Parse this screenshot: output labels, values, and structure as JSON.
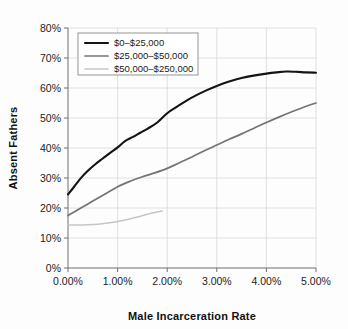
{
  "chart_data": {
    "type": "line",
    "title": "",
    "xlabel": "Male Incarceration Rate",
    "ylabel": "Absent Fathers",
    "xlim": [
      0,
      5
    ],
    "ylim": [
      0,
      80
    ],
    "grid": true,
    "legend_position": "top-left",
    "x_tick_labels": [
      "0.00%",
      "1.00%",
      "2.00%",
      "3.00%",
      "4.00%",
      "5.00%"
    ],
    "x_ticks": [
      0,
      1,
      2,
      3,
      4,
      5
    ],
    "y_tick_labels": [
      "0%",
      "10%",
      "20%",
      "30%",
      "40%",
      "50%",
      "60%",
      "70%",
      "80%"
    ],
    "y_ticks": [
      0,
      10,
      20,
      30,
      40,
      50,
      60,
      70,
      80
    ],
    "series": [
      {
        "name": "$0–$25,000",
        "color": "#141414",
        "width": 2.1,
        "x": [
          0.0,
          0.12,
          0.25,
          0.4,
          0.55,
          0.7,
          0.85,
          1.0,
          1.15,
          1.3,
          1.45,
          1.6,
          1.8,
          2.0,
          2.2,
          2.4,
          2.6,
          2.8,
          3.0,
          3.2,
          3.4,
          3.6,
          3.8,
          4.0,
          4.2,
          4.4,
          4.6,
          4.8,
          5.0
        ],
        "values": [
          24.5,
          27.0,
          29.8,
          32.4,
          34.6,
          36.5,
          38.4,
          40.2,
          42.3,
          43.6,
          45.0,
          46.4,
          48.5,
          51.6,
          53.8,
          55.9,
          57.7,
          59.3,
          60.7,
          61.9,
          62.9,
          63.7,
          64.3,
          64.8,
          65.2,
          65.5,
          65.4,
          65.2,
          65.1
        ]
      },
      {
        "name": "$25,000–$50,000",
        "color": "#747474",
        "width": 1.7,
        "x": [
          0.0,
          0.25,
          0.5,
          0.75,
          1.0,
          1.25,
          1.5,
          1.75,
          2.0,
          2.25,
          2.5,
          2.75,
          3.0,
          3.25,
          3.5,
          3.75,
          4.0,
          4.25,
          4.5,
          4.75,
          5.0
        ],
        "values": [
          17.5,
          19.9,
          22.3,
          24.7,
          27.1,
          28.9,
          30.4,
          31.7,
          33.2,
          35.1,
          37.0,
          39.1,
          41.0,
          42.9,
          44.7,
          46.6,
          48.5,
          50.3,
          52.0,
          53.6,
          55.0
        ]
      },
      {
        "name": "$50,000–$250,000",
        "color": "#c6c6c6",
        "width": 1.5,
        "x": [
          0.0,
          0.2,
          0.4,
          0.6,
          0.8,
          1.0,
          1.2,
          1.4,
          1.6,
          1.75,
          1.9
        ],
        "values": [
          14.3,
          14.3,
          14.4,
          14.6,
          15.0,
          15.5,
          16.2,
          17.0,
          17.9,
          18.5,
          19.0
        ]
      }
    ]
  }
}
